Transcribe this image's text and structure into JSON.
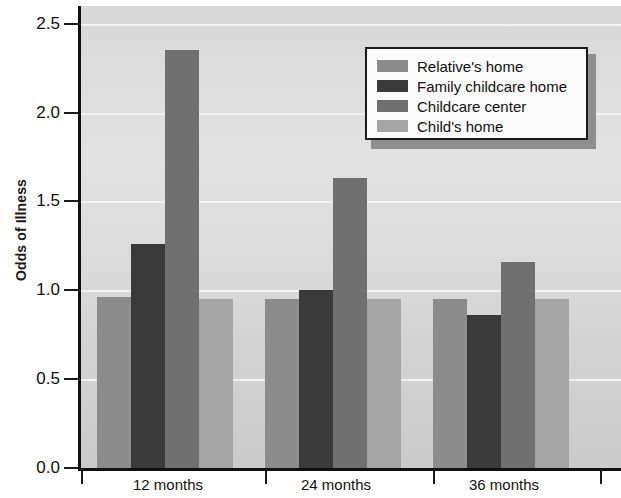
{
  "chart_data": {
    "type": "bar",
    "title": "",
    "subtitle": "",
    "xlabel": "",
    "ylabel": "Odds of Illness",
    "categories": [
      "12 months",
      "24 months",
      "36 months"
    ],
    "series": [
      {
        "name": "Relative's home",
        "color": "#8c8c8c",
        "values": [
          0.96,
          0.95,
          0.95
        ]
      },
      {
        "name": "Family childcare home",
        "color": "#3a3a3a",
        "values": [
          1.26,
          1.0,
          0.86
        ]
      },
      {
        "name": "Childcare center",
        "color": "#707070",
        "values": [
          2.35,
          1.63,
          1.16
        ]
      },
      {
        "name": "Child's home",
        "color": "#a5a5a5",
        "values": [
          0.95,
          0.95,
          0.95
        ]
      }
    ],
    "ylim": [
      0.0,
      2.6
    ],
    "yticks": [
      0.0,
      0.5,
      1.0,
      1.5,
      2.0,
      2.5
    ],
    "ytick_labels": [
      "0.0",
      "0.5",
      "1.0",
      "1.5",
      "2.0",
      "2.5"
    ],
    "gridlines": true,
    "gridline_color": "#f2f2f2",
    "legend_position": "top-right",
    "plot_background": "#dcdcdc",
    "axis_color": "#111111"
  },
  "legend": {
    "entries": [
      {
        "label": "Relative's home",
        "color": "#8c8c8c"
      },
      {
        "label": "Family childcare home",
        "color": "#3a3a3a"
      },
      {
        "label": "Childcare center",
        "color": "#707070"
      },
      {
        "label": "Child's home",
        "color": "#a5a5a5"
      }
    ]
  },
  "axes": {
    "y_title": "Odds of Illness",
    "y_tick_labels": [
      "2.5",
      "2.0",
      "1.5",
      "1.0",
      "0.5",
      "0.0"
    ],
    "x_group_labels": [
      "12 months",
      "24 months",
      "36 months"
    ]
  }
}
